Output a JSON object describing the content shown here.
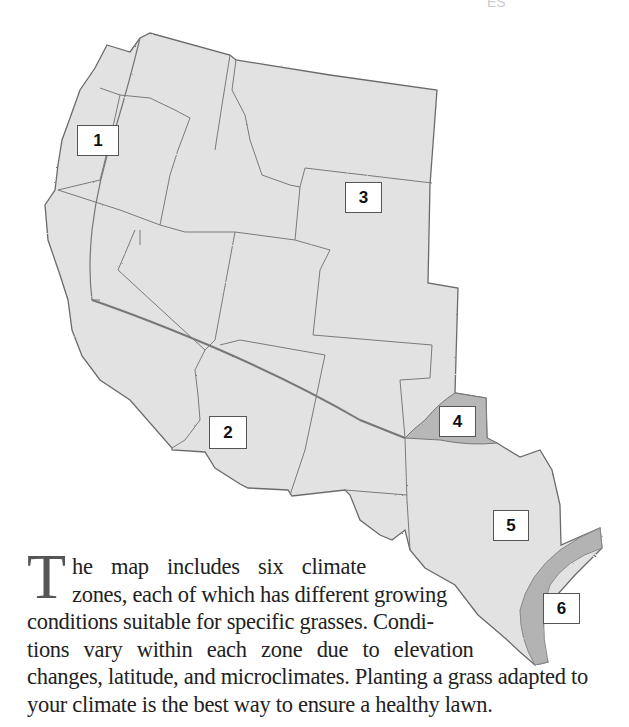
{
  "header": {
    "fragment": "ES"
  },
  "map": {
    "title": "Western U.S. climate zones map",
    "colors": {
      "land": "#e3e3e3",
      "border": "#6a6a6a",
      "zone_shaded": "#b9b9b9",
      "background": "#ffffff"
    },
    "zones": [
      {
        "id": 1,
        "label": "1",
        "x": 77,
        "y": 125,
        "w": 42,
        "h": 31
      },
      {
        "id": 2,
        "label": "2",
        "x": 209,
        "y": 416,
        "w": 38,
        "h": 33
      },
      {
        "id": 3,
        "label": "3",
        "x": 345,
        "y": 182,
        "w": 37,
        "h": 31
      },
      {
        "id": 4,
        "label": "4",
        "x": 439,
        "y": 406,
        "w": 37,
        "h": 31
      },
      {
        "id": 5,
        "label": "5",
        "x": 493,
        "y": 510,
        "w": 36,
        "h": 31
      },
      {
        "id": 6,
        "label": "6",
        "x": 543,
        "y": 593,
        "w": 37,
        "h": 31
      }
    ]
  },
  "caption": {
    "dropcap": "T",
    "lines": [
      "he map includes six climate",
      "zones, each of which has different growing",
      "conditions suitable for specific grasses. Condi-",
      "tions vary within each zone due to elevation",
      "changes, latitude, and microclimates. Planting a grass adapted to",
      "your climate is the best way to ensure a healthy lawn."
    ]
  }
}
